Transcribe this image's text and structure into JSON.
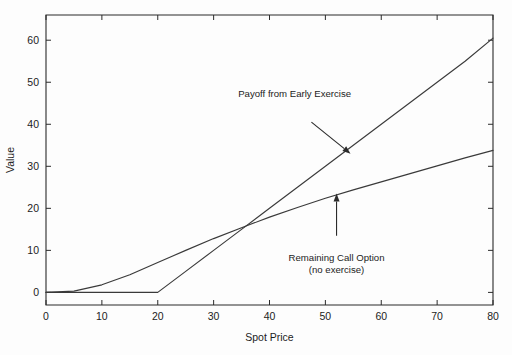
{
  "chart_data": {
    "type": "line",
    "title": "",
    "xlabel": "Spot Price",
    "ylabel": "Value",
    "xlim": [
      0,
      80
    ],
    "ylim": [
      -3,
      66
    ],
    "grid": false,
    "legend": "none",
    "xticks": [
      0,
      10,
      20,
      30,
      40,
      50,
      60,
      70,
      80
    ],
    "xticklabels": [
      "0",
      "10",
      "20",
      "30",
      "40",
      "50",
      "60",
      "70",
      "80"
    ],
    "yticks": [
      0,
      10,
      20,
      30,
      40,
      50,
      60
    ],
    "yticklabels": [
      "0",
      "10",
      "20",
      "30",
      "40",
      "50",
      "60"
    ],
    "series": [
      {
        "name": "Payoff from Early Exercise",
        "x": [
          0,
          5,
          10,
          15,
          20,
          25,
          30,
          35,
          40,
          45,
          50,
          55,
          60,
          65,
          70,
          75,
          80
        ],
        "values": [
          0,
          0,
          0,
          0,
          0,
          5,
          10,
          15,
          20,
          25,
          30,
          35,
          40,
          45,
          50,
          55,
          60.5
        ]
      },
      {
        "name": "Remaining Call Option (no exercise)",
        "x": [
          0,
          5,
          10,
          15,
          20,
          25,
          30,
          35,
          40,
          45,
          50,
          55,
          60,
          65,
          70,
          75,
          80
        ],
        "values": [
          0.0,
          0.3,
          1.8,
          4.2,
          7.1,
          10.0,
          12.8,
          15.4,
          17.9,
          20.2,
          22.4,
          24.4,
          26.3,
          28.2,
          30.1,
          32.0,
          33.8
        ]
      }
    ],
    "annotations": [
      {
        "name": "payoff-annotation",
        "lines": [
          "Payoff from Early Exercise"
        ],
        "text_x": 44.5,
        "text_y": 46.5,
        "arrow_from": [
          47.5,
          40.5
        ],
        "arrow_to": [
          54.5,
          33.0
        ]
      },
      {
        "name": "call-option-annotation",
        "lines": [
          "Remaining Call Option",
          "(no exercise)"
        ],
        "text_x": 52.0,
        "text_y": 7.5,
        "arrow_from": [
          52.0,
          13.5
        ],
        "arrow_to": [
          52.0,
          23.5
        ]
      }
    ],
    "colors": {
      "background": "#fdfdfd",
      "axis": "#2b2b2b",
      "series_line": "#3a3a3a",
      "text": "#1c1c1c"
    }
  }
}
